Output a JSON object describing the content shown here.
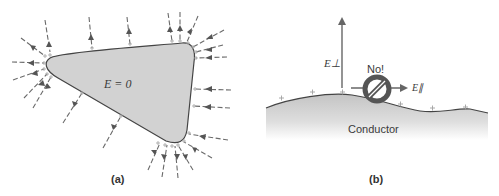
{
  "panel_a": {
    "label": "(a)",
    "inside_label": "E = 0",
    "shape_fill": "#d2d2d2",
    "outline_color": "#444444",
    "field_line_color": "#6a6a6a",
    "charge_symbol": "+"
  },
  "panel_b": {
    "label": "(b)",
    "conductor_label": "Conductor",
    "perp_label": "E⊥",
    "parallel_label": "E∥",
    "forbidden_label": "No!",
    "forbidden_symbol": "prohibited-sign",
    "charge_symbol": "+"
  }
}
